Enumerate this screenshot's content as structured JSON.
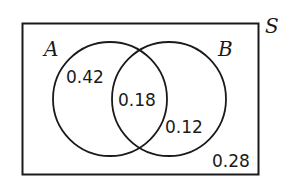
{
  "diagram": {
    "type": "venn",
    "universal_set": {
      "label": "S"
    },
    "sets": [
      {
        "label": "A"
      },
      {
        "label": "B"
      }
    ],
    "regions": {
      "a_only": "0.42",
      "a_and_b": "0.18",
      "b_only": "0.12",
      "outside": "0.28"
    },
    "colors": {
      "stroke": "#1a1a1a",
      "background": "#ffffff"
    }
  }
}
